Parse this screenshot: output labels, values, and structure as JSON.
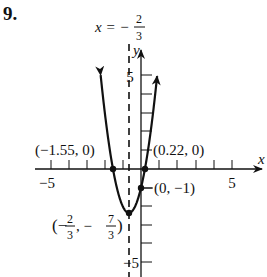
{
  "problem_number": "9.",
  "chart_data": {
    "type": "line",
    "title": "",
    "function": "y = 3x^2 + 4x - 1",
    "xlabel": "x",
    "ylabel": "y",
    "xlim": [
      -5.5,
      6.5
    ],
    "ylim": [
      -5.5,
      6.2
    ],
    "x_ticks": [
      -5,
      -4,
      -3,
      -2,
      -1,
      1,
      2,
      3,
      4,
      5
    ],
    "y_ticks": [
      -5,
      -4,
      -3,
      -2,
      -1,
      1,
      2,
      3,
      4,
      5
    ],
    "x_tick_labels": [
      "-5",
      "5"
    ],
    "y_tick_labels": [
      "5",
      "-5"
    ],
    "grid": false,
    "series": [
      {
        "name": "parabola",
        "x": [
          -2.22,
          -2.0,
          -1.55,
          -1.0,
          -0.667,
          0.0,
          0.22,
          0.5,
          0.89
        ],
        "y": [
          5.0,
          3.0,
          0.0,
          -2.0,
          -2.333,
          -1.0,
          0.0,
          1.75,
          4.94
        ]
      }
    ],
    "axis_of_symmetry": {
      "x": -0.667,
      "label_x": "x = −",
      "label_num": "2",
      "label_den": "3"
    },
    "points": [
      {
        "name": "x-intercept-left",
        "x": -1.55,
        "y": 0,
        "label": "(−1.55, 0)"
      },
      {
        "name": "x-intercept-right",
        "x": 0.22,
        "y": 0,
        "label": "(0.22, 0)"
      },
      {
        "name": "y-intercept",
        "x": 0,
        "y": -1,
        "label": "(0, −1)"
      },
      {
        "name": "vertex",
        "x": -0.667,
        "y": -2.333,
        "label_open": "(−",
        "label_n1": "2",
        "label_d1": "3",
        "label_sep": ", −",
        "label_n2": "7",
        "label_d2": "3",
        "label_close": ")"
      }
    ]
  },
  "labels": {
    "x_axis": "x",
    "y_axis": "y",
    "x_min_tick": "−5",
    "x_max_tick": "5",
    "y_max_tick": "5",
    "y_min_tick": "−5",
    "left_intercept": "(−1.55, 0)",
    "right_intercept": "(0.22, 0)",
    "y_intercept": "(0, −1)",
    "aos_prefix": "x = −",
    "aos_num": "2",
    "aos_den": "3",
    "vertex_open": "(−",
    "vertex_n1": "2",
    "vertex_d1": "3",
    "vertex_sep": ", −",
    "vertex_n2": "7",
    "vertex_d2": "3",
    "vertex_close": ")"
  }
}
